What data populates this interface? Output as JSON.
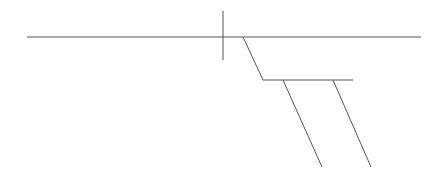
{
  "diagram": {
    "type": "line-drawing",
    "stroke_color": "#555555",
    "background": "#ffffff",
    "width": 446,
    "height": 177,
    "segments": [
      {
        "name": "main-horizontal-line",
        "x1": 27,
        "y1": 37,
        "x2": 421,
        "y2": 37
      },
      {
        "name": "vertical-tick-line",
        "x1": 223,
        "y1": 11,
        "x2": 223,
        "y2": 60
      },
      {
        "name": "first-slant-line",
        "x1": 243,
        "y1": 37,
        "x2": 263,
        "y2": 80
      },
      {
        "name": "secondary-horizontal-line",
        "x1": 263,
        "y1": 80,
        "x2": 353,
        "y2": 80
      },
      {
        "name": "left-lower-slant-line",
        "x1": 283,
        "y1": 80,
        "x2": 322,
        "y2": 167
      },
      {
        "name": "right-lower-slant-line",
        "x1": 333,
        "y1": 80,
        "x2": 371,
        "y2": 167
      }
    ]
  }
}
